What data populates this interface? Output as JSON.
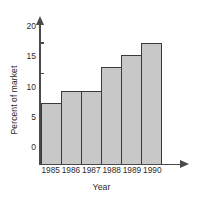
{
  "chart_data": {
    "type": "bar",
    "title": "",
    "subtitle": "",
    "xlabel": "Year",
    "ylabel": "Percent of market",
    "categories": [
      "1985",
      "1986",
      "1987",
      "1988",
      "1989",
      "1990"
    ],
    "values": [
      10,
      12,
      12,
      16,
      18,
      20
    ],
    "series": [
      {
        "name": "Percent of market",
        "values": [
          10,
          12,
          12,
          16,
          18,
          20
        ]
      }
    ],
    "ylim": [
      0,
      22
    ],
    "yticks": [
      0,
      5,
      10,
      15,
      20
    ],
    "ytick_labels": [
      "0",
      "5",
      "10",
      "15",
      "20"
    ],
    "xtick_labels": [
      "1985",
      "1986",
      "1987",
      "1988",
      "1989",
      "1990"
    ],
    "grid": false,
    "legend": false,
    "legend_position": "none",
    "annotations": [],
    "bar_fill_color": "#c8c8c8",
    "bar_edge_color": "#3a3a3a",
    "axis_color": "#4a4a4a",
    "background_color": "#ffffff",
    "axis_arrows": true
  }
}
